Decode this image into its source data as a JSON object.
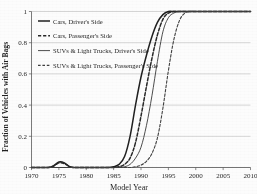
{
  "chart_data": {
    "type": "line",
    "title": "",
    "xlabel": "Model Year",
    "ylabel": "Fraction of Vehicles with Air Bags",
    "xlim": [
      1970,
      2010
    ],
    "ylim": [
      0,
      1
    ],
    "xticks": [
      1970,
      1975,
      1980,
      1985,
      1990,
      1995,
      2000,
      2005,
      2010
    ],
    "xtick_labels": [
      "1970",
      "1975",
      "1980",
      "1985",
      "1990",
      "1995",
      "2000",
      "2005",
      "2010"
    ],
    "yticks": [
      0,
      0.2,
      0.4,
      0.6,
      0.8,
      1
    ],
    "ytick_labels": [
      "0",
      "0.2",
      "0.4",
      "0.6",
      "0.8",
      "1"
    ],
    "grid": "horizontal",
    "legend_position": "upper-left-inside",
    "series": [
      {
        "name": "Cars, Driver's Side",
        "style": "solid",
        "width": 1.5,
        "color": "#1a1a1a",
        "x": [
          1970,
          1971,
          1972,
          1973,
          1974,
          1975,
          1976,
          1977,
          1978,
          1979,
          1980,
          1981,
          1982,
          1983,
          1984,
          1985,
          1986,
          1987,
          1988,
          1989,
          1990,
          1991,
          1992,
          1993,
          1994,
          1995,
          1996,
          1997,
          1998,
          1999,
          2000,
          2001,
          2002,
          2003,
          2004,
          2005,
          2006,
          2007,
          2008,
          2009,
          2010
        ],
        "y": [
          0.0,
          0.0,
          0.0,
          0.0,
          0.01,
          0.035,
          0.03,
          0.005,
          0.0,
          0.0,
          0.0,
          0.0,
          0.0,
          0.0,
          0.0,
          0.005,
          0.02,
          0.07,
          0.2,
          0.4,
          0.58,
          0.72,
          0.84,
          0.93,
          0.98,
          1.0,
          1.0,
          1.0,
          1.0,
          1.0,
          1.0,
          1.0,
          1.0,
          1.0,
          1.0,
          1.0,
          1.0,
          1.0,
          1.0,
          1.0,
          1.0
        ]
      },
      {
        "name": "Cars, Passenger's Side",
        "style": "dashed",
        "width": 1.5,
        "color": "#222222",
        "x": [
          1970,
          1971,
          1972,
          1973,
          1974,
          1975,
          1976,
          1977,
          1978,
          1979,
          1980,
          1981,
          1982,
          1983,
          1984,
          1985,
          1986,
          1987,
          1988,
          1989,
          1990,
          1991,
          1992,
          1993,
          1994,
          1995,
          1996,
          1997,
          1998,
          1999,
          2000,
          2001,
          2002,
          2003,
          2004,
          2005,
          2006,
          2007,
          2008,
          2009,
          2010
        ],
        "y": [
          0.0,
          0.0,
          0.0,
          0.0,
          0.008,
          0.03,
          0.025,
          0.004,
          0.0,
          0.0,
          0.0,
          0.0,
          0.0,
          0.0,
          0.0,
          0.0,
          0.005,
          0.02,
          0.06,
          0.16,
          0.33,
          0.52,
          0.7,
          0.85,
          0.95,
          0.99,
          1.0,
          1.0,
          1.0,
          1.0,
          1.0,
          1.0,
          1.0,
          1.0,
          1.0,
          1.0,
          1.0,
          1.0,
          1.0,
          1.0,
          1.0
        ]
      },
      {
        "name": "SUVs & Light Trucks, Driver's Side",
        "style": "solid",
        "width": 0.9,
        "color": "#333333",
        "x": [
          1970,
          1971,
          1972,
          1973,
          1974,
          1975,
          1976,
          1977,
          1978,
          1979,
          1980,
          1981,
          1982,
          1983,
          1984,
          1985,
          1986,
          1987,
          1988,
          1989,
          1990,
          1991,
          1992,
          1993,
          1994,
          1995,
          1996,
          1997,
          1998,
          1999,
          2000,
          2001,
          2002,
          2003,
          2004,
          2005,
          2006,
          2007,
          2008,
          2009,
          2010
        ],
        "y": [
          0.0,
          0.0,
          0.0,
          0.0,
          0.0,
          0.0,
          0.0,
          0.0,
          0.0,
          0.0,
          0.0,
          0.0,
          0.0,
          0.0,
          0.0,
          0.0,
          0.0,
          0.005,
          0.02,
          0.06,
          0.13,
          0.27,
          0.46,
          0.68,
          0.87,
          0.96,
          0.99,
          1.0,
          1.0,
          1.0,
          1.0,
          1.0,
          1.0,
          1.0,
          1.0,
          1.0,
          1.0,
          1.0,
          1.0,
          1.0,
          1.0
        ]
      },
      {
        "name": "SUVs & Light Trucks, Passenger's Side",
        "style": "dashed",
        "width": 1.1,
        "color": "#3a3a3a",
        "x": [
          1970,
          1971,
          1972,
          1973,
          1974,
          1975,
          1976,
          1977,
          1978,
          1979,
          1980,
          1981,
          1982,
          1983,
          1984,
          1985,
          1986,
          1987,
          1988,
          1989,
          1990,
          1991,
          1992,
          1993,
          1994,
          1995,
          1996,
          1997,
          1998,
          1999,
          2000,
          2001,
          2002,
          2003,
          2004,
          2005,
          2006,
          2007,
          2008,
          2009,
          2010
        ],
        "y": [
          0.0,
          0.0,
          0.0,
          0.0,
          0.0,
          0.0,
          0.0,
          0.0,
          0.0,
          0.0,
          0.0,
          0.0,
          0.0,
          0.0,
          0.0,
          0.0,
          0.0,
          0.0,
          0.0,
          0.005,
          0.015,
          0.04,
          0.09,
          0.19,
          0.38,
          0.62,
          0.82,
          0.94,
          0.99,
          1.0,
          1.0,
          1.0,
          1.0,
          1.0,
          1.0,
          1.0,
          1.0,
          1.0,
          1.0,
          1.0,
          1.0
        ]
      }
    ]
  },
  "legend": {
    "entries": [
      "Cars, Driver's Side",
      "Cars, Passenger's Side",
      "SUVs & Light Trucks, Driver's Side",
      "SUVs & Light Trucks, Passenger's Side"
    ]
  },
  "axes": {
    "x_title": "Model Year",
    "y_title": "Fraction of Vehicles with Air Bags"
  },
  "style": {
    "background": "#ffffff",
    "axis_color": "#555555",
    "grid_color": "#b8b8b8",
    "text_color": "#1a1a1a"
  }
}
